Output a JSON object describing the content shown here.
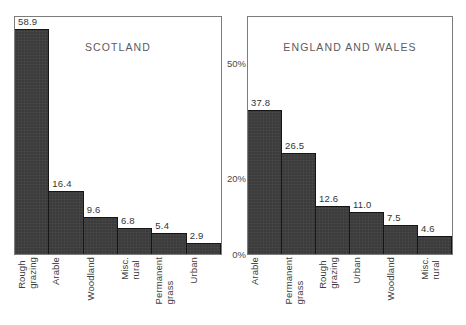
{
  "figure": {
    "yaxis": {
      "ticks": [
        "50%",
        "20%",
        "0%"
      ],
      "tick_values": [
        50,
        20,
        0
      ],
      "max": 62,
      "min": 0
    }
  },
  "chart_data": [
    {
      "type": "bar",
      "title": "SCOTLAND",
      "xlabel": "",
      "ylabel": "",
      "ylim": [
        0,
        62
      ],
      "yticks": [
        0,
        20,
        50
      ],
      "ytick_labels": [
        "0%",
        "20%",
        "50%"
      ],
      "grid": false,
      "legend": false,
      "categories": [
        "Rough grazing",
        "Arable",
        "Woodland",
        "Misc. rural",
        "Permanent grass",
        "Urban"
      ],
      "category_lines": [
        [
          "Rough",
          "grazing"
        ],
        [
          "Arable"
        ],
        [
          "Woodland"
        ],
        [
          "Misc.",
          "rural"
        ],
        [
          "Permanent",
          "grass"
        ],
        [
          "Urban"
        ]
      ],
      "values": [
        58.9,
        16.4,
        9.6,
        6.8,
        5.4,
        2.9
      ],
      "value_labels": [
        "58.9",
        "16.4",
        "9.6",
        "6.8",
        "5.4",
        "2.9"
      ]
    },
    {
      "type": "bar",
      "title": "ENGLAND AND WALES",
      "xlabel": "",
      "ylabel": "",
      "ylim": [
        0,
        62
      ],
      "yticks": [
        0,
        20,
        50
      ],
      "ytick_labels": [
        "0%",
        "20%",
        "50%"
      ],
      "grid": false,
      "legend": false,
      "categories": [
        "Arable",
        "Permanent grass",
        "Rough grazing",
        "Urban",
        "Woodland",
        "Misc. rural"
      ],
      "category_lines": [
        [
          "Arable"
        ],
        [
          "Permanent",
          "grass"
        ],
        [
          "Rough",
          "grazing"
        ],
        [
          "Urban"
        ],
        [
          "Woodland"
        ],
        [
          "Misc.",
          "rural"
        ]
      ],
      "values": [
        37.8,
        26.5,
        12.6,
        11.0,
        7.5,
        4.6
      ],
      "value_labels": [
        "37.8",
        "26.5",
        "12.6",
        "11.0",
        "7.5",
        "4.6"
      ]
    }
  ],
  "style": {
    "bar_fill": "#3b3b3b",
    "bar_edge": "#151515",
    "frame": "#7c7c7c",
    "text": "#3d3d3d",
    "background": "#ffffff"
  }
}
